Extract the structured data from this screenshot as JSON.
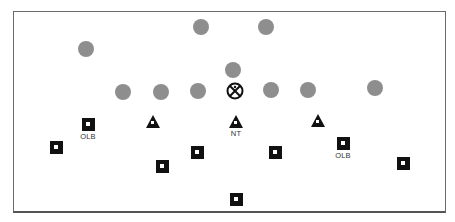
{
  "diagram": {
    "type": "football-formation",
    "colors": {
      "offense": "#8e8e8e",
      "defense": "#111111",
      "frame": "#6a6a6a",
      "background": "#ffffff"
    },
    "offense": [
      {
        "id": "o1",
        "x": 201,
        "y": 27
      },
      {
        "id": "o2",
        "x": 266,
        "y": 27
      },
      {
        "id": "o3",
        "x": 86,
        "y": 49
      },
      {
        "id": "o4",
        "x": 233,
        "y": 70
      },
      {
        "id": "o5",
        "x": 123,
        "y": 92
      },
      {
        "id": "o6",
        "x": 161,
        "y": 92
      },
      {
        "id": "o7",
        "x": 198,
        "y": 91
      },
      {
        "id": "o8",
        "x": 271,
        "y": 90
      },
      {
        "id": "o9",
        "x": 308,
        "y": 90
      },
      {
        "id": "o10",
        "x": 375,
        "y": 88
      }
    ],
    "center": {
      "id": "center",
      "x": 235,
      "y": 91,
      "symbol": "circle-x"
    },
    "defense_triangles": [
      {
        "id": "t1",
        "x": 153,
        "y": 122,
        "label": ""
      },
      {
        "id": "t2",
        "x": 236,
        "y": 122,
        "label": "NT"
      },
      {
        "id": "t3",
        "x": 318,
        "y": 121,
        "label": ""
      }
    ],
    "defense_squares": [
      {
        "id": "s1",
        "x": 88,
        "y": 124,
        "label": "OLB"
      },
      {
        "id": "s2",
        "x": 56,
        "y": 147,
        "label": ""
      },
      {
        "id": "s3",
        "x": 162,
        "y": 166,
        "label": ""
      },
      {
        "id": "s4",
        "x": 197,
        "y": 152,
        "label": ""
      },
      {
        "id": "s5",
        "x": 275,
        "y": 152,
        "label": ""
      },
      {
        "id": "s6",
        "x": 343,
        "y": 143,
        "label": "OLB"
      },
      {
        "id": "s7",
        "x": 403,
        "y": 163,
        "label": ""
      },
      {
        "id": "s8",
        "x": 236,
        "y": 199,
        "label": ""
      }
    ]
  },
  "labels": {
    "olb_left": "OLB",
    "nt": "NT",
    "olb_right": "OLB"
  }
}
